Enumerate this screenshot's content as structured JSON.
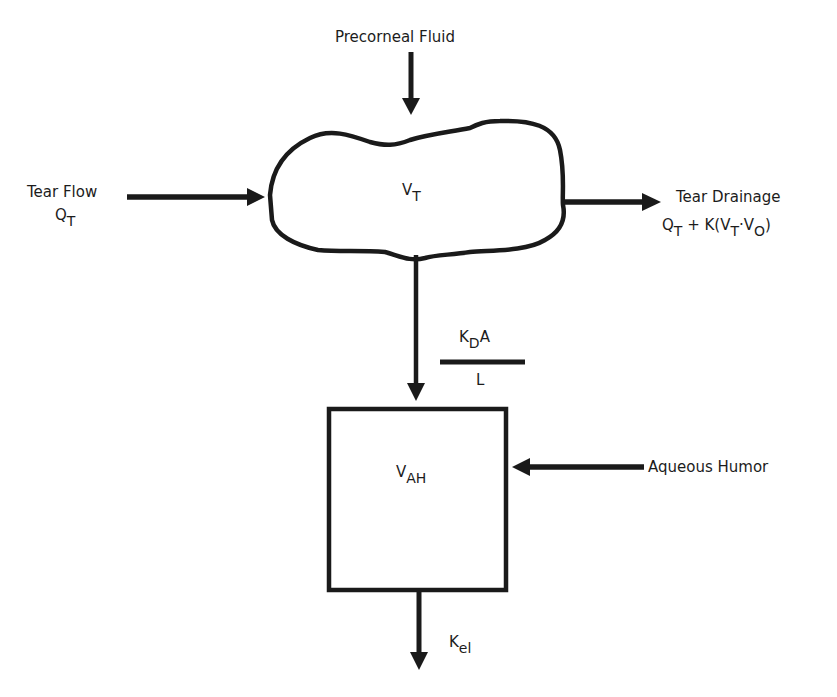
{
  "diagram": {
    "nodes": {
      "tear_compartment": {
        "symbol": "V",
        "subscript": "T"
      },
      "aqueous_compartment": {
        "symbol": "V",
        "subscript": "AH"
      }
    },
    "inputs": {
      "precorneal_fluid": {
        "label": "Precorneal Fluid"
      },
      "tear_flow": {
        "label": "Tear Flow",
        "symbol": "Q",
        "subscript": "T"
      },
      "aqueous_humor": {
        "label": "Aqueous Humor"
      }
    },
    "outputs": {
      "tear_drainage": {
        "label": "Tear Drainage",
        "expr_q": "Q",
        "expr_q_sub": "T",
        "expr_plus": " + K(V",
        "expr_vt_sub": "T",
        "expr_dot": "·V",
        "expr_vo_sub": "O",
        "expr_close": ")"
      },
      "elimination": {
        "symbol": "K",
        "subscript": "el"
      }
    },
    "transfer": {
      "numerator_k": "K",
      "numerator_sub": "D",
      "numerator_a": "A",
      "denominator": "L"
    },
    "colors": {
      "stroke": "#1a1a1a",
      "background": "#ffffff"
    }
  }
}
